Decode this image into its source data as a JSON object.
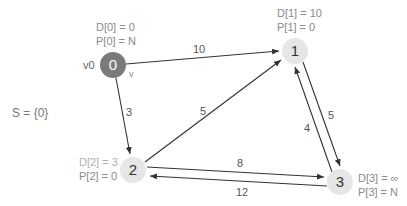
{
  "set_label": "S = {0}",
  "colors": {
    "visited_node": "#7a7a7a",
    "unvisited_node": "#e6e6e6",
    "edge": "#333333",
    "label": "#8a8a8a"
  },
  "nodes": [
    {
      "id": "0",
      "label": "0",
      "name_tag": "v0",
      "cursor_tag": "v",
      "d": "D[0] = 0",
      "p": "P[0] = N",
      "visited": true
    },
    {
      "id": "1",
      "label": "1",
      "d": "D[1] = 10",
      "p": "P[1] = 0",
      "visited": false
    },
    {
      "id": "2",
      "label": "2",
      "d": "D[2] = 3",
      "p": "P[2] = 0",
      "visited": false
    },
    {
      "id": "3",
      "label": "3",
      "d": "D[3] = ∞",
      "p": "P[3] = N",
      "visited": false
    }
  ],
  "edges": [
    {
      "from": "0",
      "to": "1",
      "weight": "10"
    },
    {
      "from": "0",
      "to": "2",
      "weight": "3"
    },
    {
      "from": "2",
      "to": "1",
      "weight": "5"
    },
    {
      "from": "1",
      "to": "3",
      "weight": "5"
    },
    {
      "from": "3",
      "to": "1",
      "weight": "4"
    },
    {
      "from": "2",
      "to": "3",
      "weight": "8"
    },
    {
      "from": "3",
      "to": "2",
      "weight": "12"
    }
  ]
}
